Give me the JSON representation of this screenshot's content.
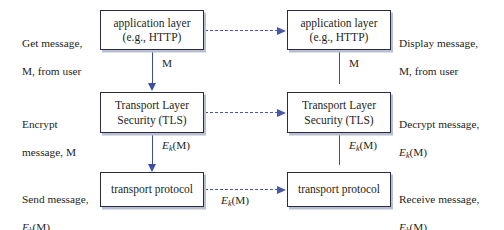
{
  "diagram": {
    "colors": {
      "box_border": "#2b2b45",
      "box_shadow": "#b9bfd0",
      "solid_arrow": "#3a4ea8",
      "dashed_arrow": "#4a56a6",
      "text": "#231f20",
      "background": "#ffffff"
    },
    "left_stack": {
      "boxes": [
        {
          "id": "left-application-layer",
          "line1": "application layer",
          "line2": "(e.g., HTTP)"
        },
        {
          "id": "left-tls",
          "line1": "Transport Layer",
          "line2": "Security (TLS)"
        },
        {
          "id": "left-transport-protocol",
          "line1": "transport protocol",
          "line2": ""
        }
      ],
      "captions": [
        {
          "id": "get-message-caption",
          "text": "Get message,\nM, from user"
        },
        {
          "id": "encrypt-message-caption",
          "text": "Encrypt\nmessage, M"
        },
        {
          "id": "send-message-caption",
          "text": "Send message,",
          "formula": true
        }
      ],
      "arrow_labels": [
        {
          "id": "left-arrow-label-m",
          "text": "M"
        },
        {
          "id": "left-arrow-label-ekm",
          "formula": true
        }
      ]
    },
    "right_stack": {
      "boxes": [
        {
          "id": "right-application-layer",
          "line1": "application layer",
          "line2": "(e.g., HTTP)"
        },
        {
          "id": "right-tls",
          "line1": "Transport Layer",
          "line2": "Security (TLS)"
        },
        {
          "id": "right-transport-protocol",
          "line1": "transport protocol",
          "line2": ""
        }
      ],
      "captions": [
        {
          "id": "display-message-caption",
          "text": "Display message,\nM, from user"
        },
        {
          "id": "decrypt-message-caption",
          "text": "Decrypt message,",
          "formula": true
        },
        {
          "id": "receive-message-caption",
          "text": "Receive message,",
          "formula": true
        }
      ],
      "arrow_labels": [
        {
          "id": "right-arrow-label-m",
          "text": "M"
        },
        {
          "id": "right-arrow-label-ekm",
          "formula": true
        }
      ]
    },
    "cross_links": [
      {
        "id": "application-layer-link",
        "label": ""
      },
      {
        "id": "tls-link",
        "label": ""
      },
      {
        "id": "transport-protocol-link",
        "formula": true
      }
    ],
    "formula": {
      "e": "E",
      "k": "k",
      "arg": "(M)",
      "plain": "Ek(M)"
    },
    "labels": {
      "m": "M",
      "get_message": "Get message,",
      "get_message_line2": "M, from user",
      "encrypt": "Encrypt",
      "encrypt_line2": "message, M",
      "send_message": "Send message,",
      "display_message": "Display message,",
      "display_message_line2": "M, from user",
      "decrypt_message": "Decrypt message,",
      "receive_message": "Receive message,",
      "application_layer": "application layer",
      "application_layer_sub": "(e.g., HTTP)",
      "transport_layer": "Transport Layer",
      "transport_layer_sub": "Security (TLS)",
      "transport_protocol": "transport protocol"
    }
  }
}
